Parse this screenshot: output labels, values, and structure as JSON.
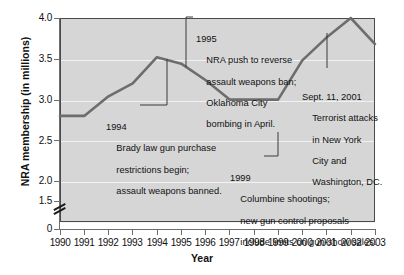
{
  "chart_data": {
    "type": "line",
    "title": "",
    "xlabel": "Year",
    "ylabel": "NRA membership (in millions)",
    "x": [
      1990,
      1991,
      1992,
      1993,
      1994,
      1995,
      1996,
      1997,
      1998,
      1999,
      2000,
      2001,
      2002,
      2003
    ],
    "values": [
      2.5,
      2.5,
      2.8,
      3.0,
      3.4,
      3.3,
      3.05,
      2.75,
      2.75,
      2.75,
      3.35,
      3.7,
      4.0,
      3.6
    ],
    "series": [
      {
        "name": "NRA membership",
        "values": [
          2.5,
          2.5,
          2.8,
          3.0,
          3.4,
          3.3,
          3.05,
          2.75,
          2.75,
          2.75,
          3.35,
          3.7,
          4.0,
          3.6
        ]
      }
    ],
    "xtick_labels": [
      "1990",
      "1991",
      "1992",
      "1993",
      "1994",
      "1995",
      "1996",
      "1997",
      "1998",
      "1999",
      "2000",
      "2001",
      "2002",
      "2003"
    ],
    "ytick_labels": [
      "0",
      "1.5",
      "2.0",
      "2.5",
      "3.0",
      "3.5",
      "4.0"
    ],
    "ytick_values": [
      0,
      1.5,
      2.0,
      2.5,
      3.0,
      3.5,
      4.0
    ],
    "ylim": [
      1.5,
      4.0
    ],
    "xlim": [
      1990,
      2003
    ],
    "grid": true,
    "legend": "none",
    "y_axis_break": true,
    "line_color": "#6d6d6d",
    "plot_background": "#d6d6d6",
    "gridline_color": "#f2f2f2",
    "annotations": [
      {
        "id": "anno-1994",
        "year": "1994",
        "lines": [
          "Brady law gun purchase",
          "restrictions begin;",
          "assault weapons banned."
        ],
        "points_to_year": 1994
      },
      {
        "id": "anno-1995",
        "year": "1995",
        "lines": [
          "NRA push to reverse",
          "assault weapons ban;",
          "Oklahoma City",
          "bombing in April."
        ],
        "points_to_year": 1995
      },
      {
        "id": "anno-2001",
        "year": "Sept. 11, 2001",
        "lines": [
          "Terrorist attacks",
          "in New York",
          "City and",
          "Washington, DC."
        ],
        "points_to_year": 2001
      },
      {
        "id": "anno-1999",
        "year": "1999",
        "lines": [
          "Columbine shootings;",
          "new gun control proposals",
          "include limits on gun-show sales."
        ],
        "points_to_year": 1999
      }
    ]
  }
}
